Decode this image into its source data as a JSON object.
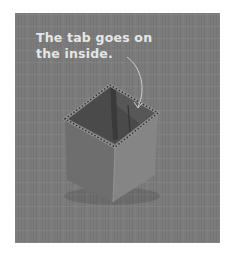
{
  "caption": {
    "line1": "The tab goes on",
    "line2": "the inside."
  },
  "colors": {
    "page_background": "#ffffff",
    "photo_background": "#7b7b7b",
    "caption_text": "#e6e6e6",
    "arrow": "#cfcfcf"
  },
  "image": {
    "subject": "open corrugated cardboard box with inside tab",
    "annotation": "curved arrow pointing to tab inside box"
  }
}
